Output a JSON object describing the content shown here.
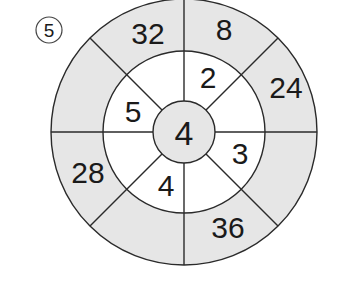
{
  "problem": {
    "number": "5"
  },
  "colors": {
    "outer_ring_fill": "#e6e6e6",
    "inner_ring_fill": "#ffffff",
    "center_fill": "#e6e6e6",
    "stroke": "#2a2a2a",
    "text": "#1a1a1a"
  },
  "wheel": {
    "center": {
      "value": "4"
    },
    "inner_ring": [
      {
        "position": "top-right",
        "value": "2"
      },
      {
        "position": "right-lower",
        "value": "3"
      },
      {
        "position": "bottom-left",
        "value": "4"
      },
      {
        "position": "left-upper",
        "value": "5"
      }
    ],
    "outer_ring": [
      {
        "position": "top-left",
        "value": "32"
      },
      {
        "position": "top-right",
        "value": "8"
      },
      {
        "position": "right-upper",
        "value": "24"
      },
      {
        "position": "bottom-right",
        "value": "36"
      },
      {
        "position": "left-lower",
        "value": "28"
      }
    ]
  }
}
